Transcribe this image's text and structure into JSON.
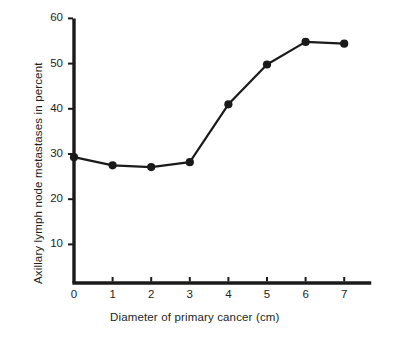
{
  "chart_data": {
    "type": "line",
    "title": "",
    "subtitle": "",
    "xlabel": "Diameter of primary cancer (cm)",
    "ylabel": "Axillary lymph node metastases in percent",
    "x": [
      0,
      1,
      2,
      3,
      4,
      5,
      6,
      7
    ],
    "values": [
      29.3,
      27.5,
      27.1,
      28.2,
      41.0,
      49.8,
      54.8,
      54.4
    ],
    "series": [
      {
        "name": "Axillary lymph node metastases",
        "values": [
          29.3,
          27.5,
          27.1,
          28.2,
          41.0,
          49.8,
          54.8,
          54.4
        ]
      }
    ],
    "xlim": [
      0,
      7.7
    ],
    "ylim": [
      0,
      60
    ],
    "xticks": [
      0,
      1,
      2,
      3,
      4,
      5,
      6,
      7
    ],
    "yticks": [
      10,
      20,
      30,
      40,
      50,
      60
    ],
    "xtick_labels": [
      "0",
      "1",
      "2",
      "3",
      "4",
      "5",
      "6",
      "7"
    ],
    "ytick_labels": [
      "10",
      "20",
      "30",
      "40",
      "50",
      "60"
    ],
    "grid": false,
    "legend": null,
    "marker": "filled-circle",
    "line_color": "#1a1a1a",
    "marker_color": "#1a1a1a",
    "axis_color": "#1a1a1a",
    "background": "#ffffff",
    "annotations": []
  },
  "axes": {
    "x_title": "Diameter of primary cancer (cm)",
    "y_title": "Axillary lymph node metastases in percent"
  },
  "ticks": {
    "y": [
      {
        "label": "60",
        "value": 60
      },
      {
        "label": "50",
        "value": 50
      },
      {
        "label": "40",
        "value": 40
      },
      {
        "label": "30",
        "value": 30
      },
      {
        "label": "20",
        "value": 20
      },
      {
        "label": "10",
        "value": 10
      }
    ],
    "x": [
      {
        "label": "0",
        "value": 0
      },
      {
        "label": "1",
        "value": 1
      },
      {
        "label": "2",
        "value": 2
      },
      {
        "label": "3",
        "value": 3
      },
      {
        "label": "4",
        "value": 4
      },
      {
        "label": "5",
        "value": 5
      },
      {
        "label": "6",
        "value": 6
      },
      {
        "label": "7",
        "value": 7
      }
    ]
  }
}
